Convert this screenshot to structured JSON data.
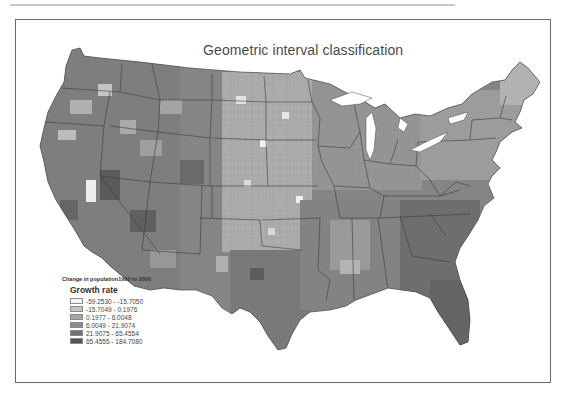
{
  "map": {
    "title": "Geometric interval classification",
    "subject": "Contiguous United States counties",
    "colors": {
      "frame": "#6a6a6a",
      "state_border": "#3a3a3a",
      "class_1": "#f4f4f4",
      "class_2": "#c6c6c6",
      "class_3": "#a6a6a6",
      "class_4": "#8c8c8c",
      "class_5": "#727272",
      "class_6": "#545454"
    }
  },
  "legend": {
    "caption": "Change in population1990 to 2000",
    "heading": "Growth rate",
    "items": [
      {
        "label": "-59.2530 - -15.7050",
        "color": "#f4f4f4"
      },
      {
        "label": "-15.7049 - 0.1976",
        "color": "#c6c6c6"
      },
      {
        "label": "0.1977 - 6.0048",
        "color": "#a6a6a6"
      },
      {
        "label": "6.0049 - 21.9074",
        "color": "#8c8c8c"
      },
      {
        "label": "21.9075 - 65.4554",
        "color": "#727272"
      },
      {
        "label": "65.4555 - 184.7080",
        "color": "#545454"
      }
    ]
  }
}
